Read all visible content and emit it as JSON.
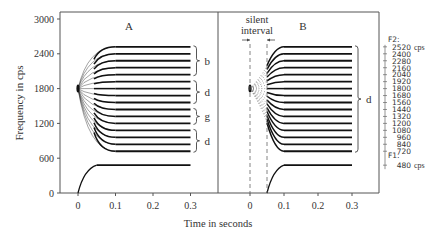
{
  "chart_data": {
    "type": "line",
    "title": "",
    "ylabel": "Frequency in cps",
    "xlabel": "Time in seconds",
    "ylim": [
      0,
      3000
    ],
    "yticks": [
      0,
      600,
      1200,
      1800,
      2400,
      3000
    ],
    "panels": [
      {
        "label": "A",
        "xlim": [
          -0.05,
          0.37
        ],
        "xticks": [
          0,
          0.1,
          0.2,
          0.3
        ],
        "locus_hz": 1800,
        "transition_end_s": 0.1,
        "steady_end_s": 0.3,
        "f2_targets_hz": [
          2520,
          2400,
          2280,
          2160,
          2040,
          1920,
          1800,
          1680,
          1560,
          1440,
          1320,
          1200,
          1080,
          960,
          840,
          720
        ],
        "f1": {
          "start_hz": 0,
          "start_s": 0,
          "target_hz": 480,
          "transition_end_s": 0.05,
          "end_s": 0.3
        },
        "brackets": [
          {
            "label": "b",
            "from_hz": 2040,
            "to_hz": 2520
          },
          {
            "label": "d",
            "from_hz": 1560,
            "to_hz": 1920
          },
          {
            "label": "g",
            "from_hz": 1200,
            "to_hz": 1440
          },
          {
            "label": "d",
            "from_hz": 720,
            "to_hz": 1080
          }
        ]
      },
      {
        "label": "B",
        "xlim": [
          -0.1,
          0.37
        ],
        "xticks": [
          0,
          0.1,
          0.2,
          0.3
        ],
        "locus_hz": 1800,
        "silent_interval_s": [
          0,
          0.05
        ],
        "annotation": "silent interval",
        "transition_start_s": 0.05,
        "transition_end_s": 0.1,
        "steady_end_s": 0.3,
        "f2_targets_hz": [
          2520,
          2400,
          2280,
          2160,
          2040,
          1920,
          1800,
          1680,
          1560,
          1440,
          1320,
          1200,
          1080,
          960,
          840,
          720
        ],
        "f1": {
          "start_hz": 0,
          "start_s": 0.05,
          "target_hz": 480,
          "transition_end_s": 0.1,
          "end_s": 0.3
        },
        "brackets": [
          {
            "label": "d",
            "from_hz": 720,
            "to_hz": 2520
          }
        ]
      }
    ],
    "right_scale": {
      "f2_label": "F2:",
      "f2_values": [
        "2520",
        "2400",
        "2280",
        "2160",
        "2040",
        "1920",
        "1800",
        "1680",
        "1560",
        "1440",
        "1320",
        "1200",
        "1080",
        "960",
        "840",
        "720"
      ],
      "f1_label": "F1:",
      "f1_value": "480",
      "unit": "cps"
    }
  },
  "labels": {
    "ylabel": "Frequency in cps",
    "xlabel": "Time in seconds",
    "panel_a": "A",
    "panel_b": "B",
    "silent_1": "silent",
    "silent_2": "interval",
    "f2": "F2:",
    "f1": "F1:",
    "cps": "cps",
    "f1_val": "480"
  }
}
